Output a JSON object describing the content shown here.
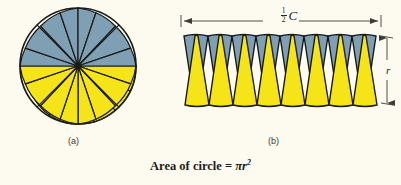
{
  "figure": {
    "background_color": "#fdfbf0",
    "wedge_blue": "#7e9fb4",
    "wedge_yellow": "#f4e418",
    "stroke_color": "#1a1a18",
    "caption": {
      "text_prefix": "Area of circle = ",
      "formula_base": "πr",
      "formula_exponent": "2",
      "full_text": "Area of circle = πr²"
    },
    "panels": [
      {
        "id": "a",
        "label": "(a)",
        "description": "circle divided into equal pie wedges, top half blue, bottom half yellow",
        "segments_total": 20,
        "segments_top_blue": 10,
        "segments_bottom_yellow": 10
      },
      {
        "id": "b",
        "label": "(b)",
        "description": "wedges rearranged into an alternating strip of yellow up-triangles and blue down-triangles",
        "yellow_wedges": 8,
        "blue_wedges": 8
      }
    ],
    "dimensions": [
      {
        "name": "half-circumference",
        "numerator": "1",
        "denominator": "2",
        "symbol": "C",
        "orientation": "horizontal",
        "arrow_style": "double-headed"
      },
      {
        "name": "radius",
        "symbol": "r",
        "orientation": "vertical",
        "arrow_style": "double-headed"
      }
    ]
  }
}
